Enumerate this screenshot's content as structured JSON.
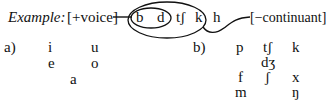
{
  "example": {
    "label": "Example:",
    "feature_left": "[+voice]",
    "segments": [
      "b",
      "d",
      "tʃ",
      "k",
      "h"
    ],
    "feature_right": "[−continuant]",
    "inner_group": [
      "b",
      "d"
    ],
    "outer_group": [
      "b",
      "d",
      "tʃ",
      "k"
    ]
  },
  "part_a": {
    "label": "a)",
    "rows": [
      [
        "i",
        "u"
      ],
      [
        "e",
        "o"
      ],
      [
        "a"
      ]
    ]
  },
  "part_b": {
    "label": "b)",
    "rows": [
      [
        "p",
        "tʃ",
        "k"
      ],
      [
        "dʒ"
      ],
      [
        "f",
        "ʃ",
        "x"
      ],
      [
        "m",
        "ŋ"
      ]
    ]
  },
  "colors": {
    "ink": "#111111",
    "background": "#ffffff"
  }
}
